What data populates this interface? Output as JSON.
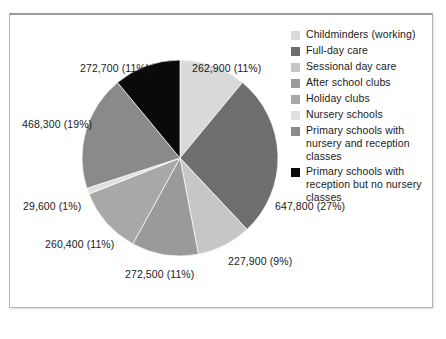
{
  "chart_data": {
    "type": "pie",
    "title": "",
    "legend_position": "right",
    "grid": false,
    "categories": [
      "Childminders (working)",
      "Full-day care",
      "Sessional day care",
      "After school clubs",
      "Holiday clubs",
      "Nursery schools",
      "Primary schools with nursery and reception classes",
      "Primary schools with reception but no nursery classes"
    ],
    "values": [
      262900,
      647800,
      227900,
      272500,
      260400,
      29600,
      468300,
      272700
    ],
    "percents": [
      11,
      27,
      9,
      11,
      11,
      1,
      19,
      11
    ],
    "value_labels": [
      "262,900 (11%)",
      "647,800 (27%)",
      "227,900 (9%)",
      "272,500 (11%)",
      "260,400 (11%)",
      "29,600 (1%)",
      "468,300 (19%)",
      "272,700 (11%)"
    ],
    "colors": [
      "#d9d9d9",
      "#6e6e6e",
      "#c6c6c6",
      "#9a9a9a",
      "#a8a8a8",
      "#e0e0e0",
      "#8a8a8a",
      "#0a0a0a"
    ],
    "xlabel": "",
    "ylabel": ""
  },
  "legend": {
    "items": [
      {
        "label": "Childminders (working)",
        "color": "#d9d9d9"
      },
      {
        "label": "Full-day care",
        "color": "#6e6e6e"
      },
      {
        "label": "Sessional day care",
        "color": "#c6c6c6"
      },
      {
        "label": "After school clubs",
        "color": "#9a9a9a"
      },
      {
        "label": "Holiday clubs",
        "color": "#a8a8a8"
      },
      {
        "label": "Nursery schools",
        "color": "#e0e0e0"
      },
      {
        "label": "Primary schools with nursery and reception classes",
        "color": "#8a8a8a"
      },
      {
        "label": "Primary schools with reception but no nursery classes",
        "color": "#0a0a0a"
      }
    ]
  },
  "labels": {
    "top_right": "262,900 (11%)",
    "top_left": "272,700 (11%)",
    "left_upper": "468,300 (19%)",
    "left_mid": "29,600 (1%)",
    "left_lower": "260,400 (11%)",
    "bottom": "272,500 (11%)",
    "bottom_right": "227,900 (9%)",
    "right": "647,800 (27%)"
  }
}
